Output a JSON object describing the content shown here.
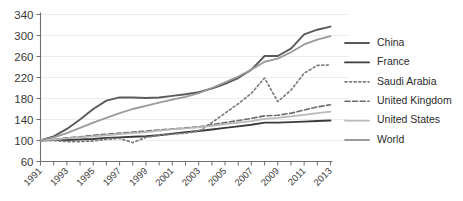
{
  "chart_data": {
    "type": "line",
    "title": "",
    "xlabel": "",
    "ylabel": "",
    "grid": true,
    "legend_position": "right",
    "ylim": [
      60,
      340
    ],
    "yticks": [
      60,
      100,
      140,
      180,
      220,
      260,
      300,
      340
    ],
    "xlim": [
      1991,
      2013
    ],
    "x": [
      1991,
      1992,
      1993,
      1994,
      1995,
      1996,
      1997,
      1998,
      1999,
      2000,
      2001,
      2002,
      2003,
      2004,
      2005,
      2006,
      2007,
      2008,
      2009,
      2010,
      2011,
      2012,
      2013
    ],
    "xticks": [
      1991,
      1992,
      1993,
      1994,
      1995,
      1996,
      1997,
      1998,
      1999,
      2000,
      2001,
      2002,
      2003,
      2004,
      2005,
      2006,
      2007,
      2008,
      2009,
      2010,
      2011,
      2012,
      2013
    ],
    "xtick_labels": [
      "1991",
      "",
      "1993",
      "",
      "1995",
      "",
      "1997",
      "",
      "1999",
      "",
      "2001",
      "",
      "2003",
      "",
      "2005",
      "",
      "2007",
      "",
      "2009",
      "",
      "2011",
      "",
      "2013"
    ],
    "series": [
      {
        "name": "China",
        "color": "#5a5a5a",
        "width": 1.9,
        "dash": "none",
        "values": [
          100,
          108,
          122,
          140,
          160,
          176,
          182,
          182,
          181,
          182,
          185,
          188,
          192,
          199,
          208,
          219,
          235,
          261,
          261,
          275,
          302,
          311,
          317
        ]
      },
      {
        "name": "France",
        "color": "#3b3b3b",
        "width": 1.9,
        "dash": "none",
        "values": [
          100,
          101,
          101,
          102,
          103,
          105,
          106,
          107,
          108,
          110,
          113,
          116,
          118,
          121,
          124,
          127,
          130,
          134,
          134,
          135,
          136,
          137,
          138
        ]
      },
      {
        "name": "Saudi Arabia",
        "color": "#7d7d7d",
        "width": 1.7,
        "dash": "2,2.6",
        "values": [
          100,
          100,
          98,
          98,
          99,
          102,
          104,
          96,
          106,
          110,
          112,
          114,
          118,
          134,
          152,
          170,
          190,
          219,
          174,
          196,
          228,
          243,
          244
        ]
      },
      {
        "name": "United Kingdom",
        "color": "#6a6a6a",
        "width": 1.6,
        "dash": "5,2.6",
        "values": [
          100,
          102,
          105,
          107,
          110,
          112,
          114,
          116,
          118,
          120,
          122,
          124,
          126,
          130,
          134,
          138,
          142,
          147,
          148,
          152,
          158,
          164,
          168
        ]
      },
      {
        "name": "United States",
        "color": "#b9b9b9",
        "width": 1.8,
        "dash": "none",
        "values": [
          100,
          102,
          104,
          106,
          108,
          110,
          112,
          114,
          116,
          119,
          121,
          123,
          125,
          128,
          131,
          134,
          137,
          141,
          143,
          146,
          149,
          152,
          155
        ]
      },
      {
        "name": "World",
        "color": "#9a9a9a",
        "width": 1.8,
        "dash": "none",
        "values": [
          100,
          106,
          114,
          124,
          134,
          143,
          152,
          160,
          166,
          172,
          178,
          183,
          190,
          200,
          211,
          222,
          235,
          250,
          256,
          268,
          283,
          292,
          299
        ]
      }
    ]
  },
  "legend": {
    "items": [
      {
        "label": "China"
      },
      {
        "label": "France"
      },
      {
        "label": "Saudi Arabia"
      },
      {
        "label": "United Kingdom"
      },
      {
        "label": "United States"
      },
      {
        "label": "World"
      }
    ]
  }
}
